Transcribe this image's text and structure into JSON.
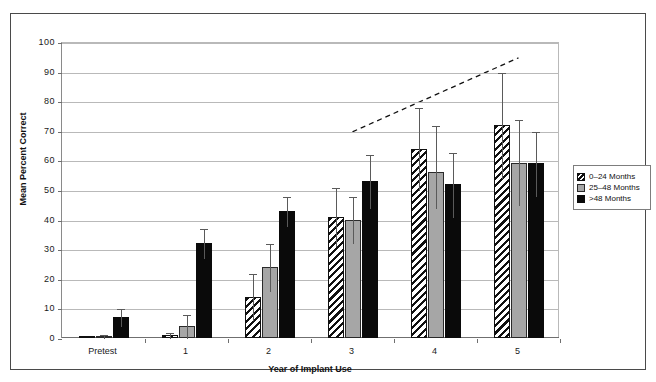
{
  "chart_data": {
    "type": "bar",
    "title": "",
    "xlabel": "Year of Implant Use",
    "ylabel": "Mean Percent Correct",
    "categories": [
      "Pretest",
      "1",
      "2",
      "3",
      "4",
      "5"
    ],
    "ylim": [
      0,
      100
    ],
    "yticks": [
      0,
      10,
      20,
      30,
      40,
      50,
      60,
      70,
      80,
      90,
      100
    ],
    "grid": true,
    "legend_position": "right",
    "series": [
      {
        "name": "0–24 Months",
        "style": "hatched",
        "values": [
          0,
          1,
          14,
          41,
          64,
          72
        ],
        "error_upper": [
          0,
          2,
          22,
          51,
          78,
          90
        ],
        "error_lower": [
          0,
          0,
          6,
          31,
          50,
          54
        ]
      },
      {
        "name": "25–48 Months",
        "style": "gray",
        "values": [
          0.5,
          4,
          24,
          40,
          56,
          59
        ],
        "error_upper": [
          1.5,
          8,
          32,
          48,
          72,
          74
        ],
        "error_lower": [
          0,
          0,
          16,
          32,
          44,
          45
        ]
      },
      {
        "name": ">48 Months",
        "style": "black",
        "values": [
          7,
          32,
          43,
          53,
          52,
          59
        ],
        "error_upper": [
          10,
          37,
          48,
          62,
          63,
          70
        ],
        "error_lower": [
          4,
          27,
          38,
          44,
          41,
          48
        ]
      }
    ],
    "annotations": [
      {
        "type": "trend-line",
        "style": "dashed",
        "x_start_category": "3",
        "y_start": 70,
        "x_end_category": "5",
        "y_end": 95
      }
    ]
  },
  "legend": {
    "items": [
      {
        "label": "0–24 Months",
        "style": "hatched"
      },
      {
        "label": "25–48 Months",
        "style": "gray"
      },
      {
        "label": ">48 Months",
        "style": "black"
      }
    ]
  }
}
